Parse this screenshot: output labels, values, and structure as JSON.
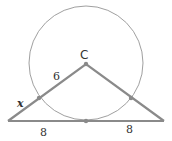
{
  "diagram": {
    "type": "geometry",
    "colors": {
      "stroke": "#8a8a8a",
      "circle": "#9a9a9a",
      "point": "#8a8a8a",
      "text": "#333333"
    },
    "circle": {
      "center_label": "C"
    },
    "labels": {
      "center": "C",
      "radius": "6",
      "external_segment": "x",
      "base_left": "8",
      "base_right": "8"
    }
  }
}
